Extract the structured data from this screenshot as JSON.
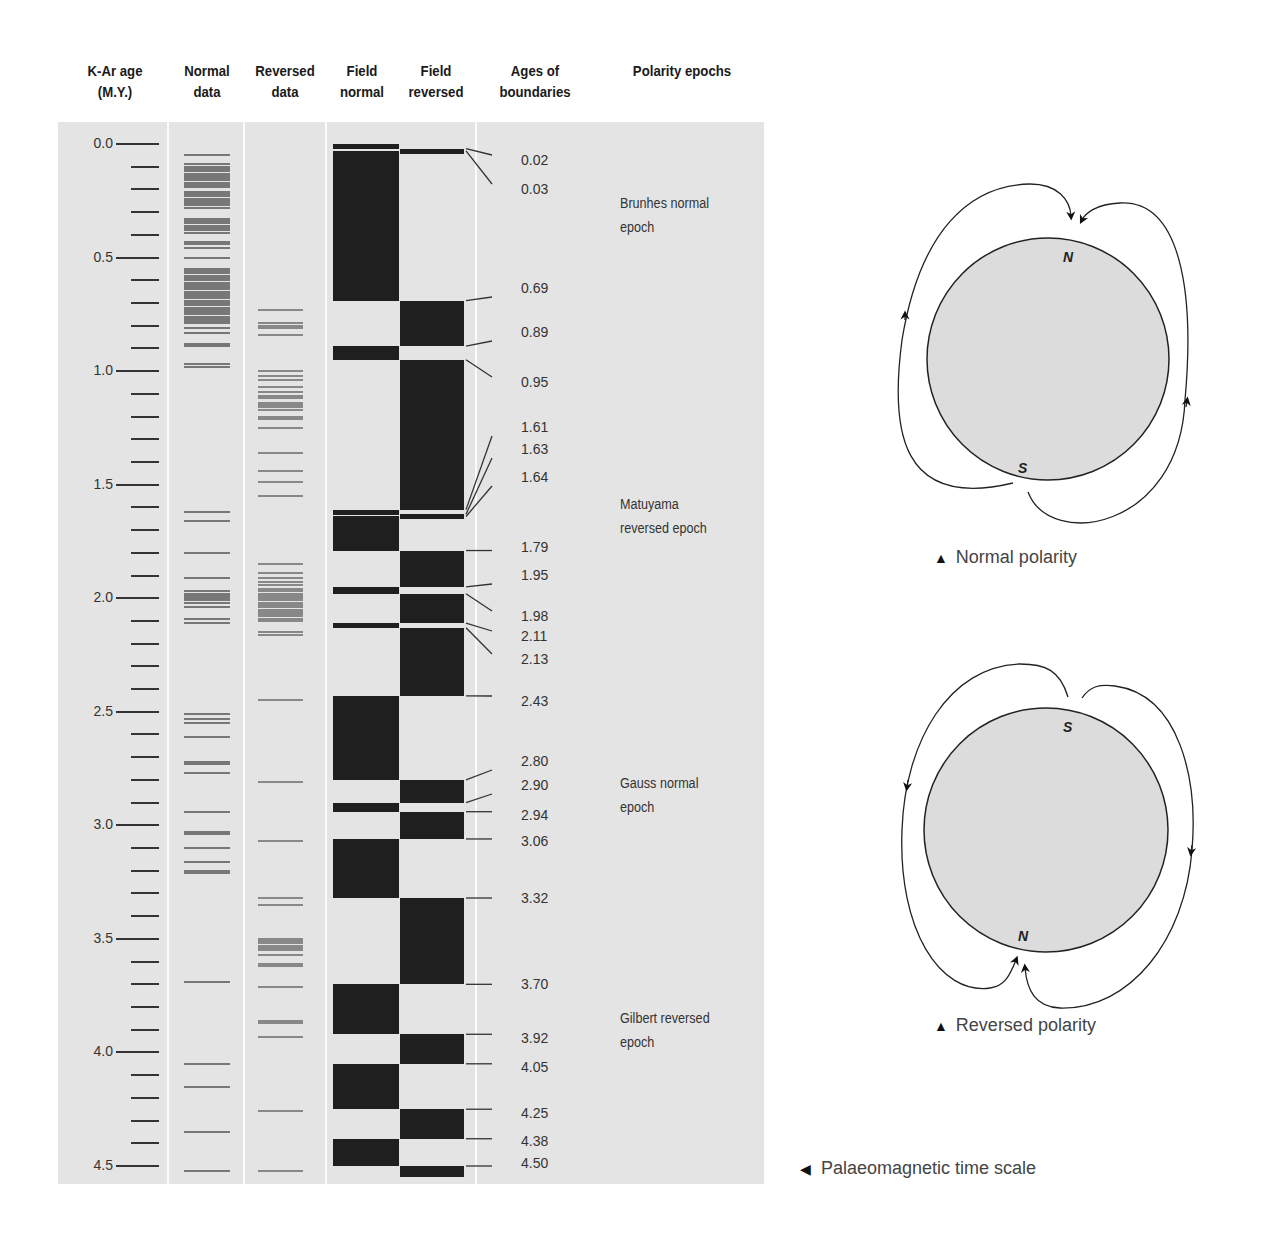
{
  "headers": {
    "age": "K-Ar age\n(M.Y.)",
    "age_l1": "K-Ar age",
    "age_l2": "(M.Y.)",
    "normal_l1": "Normal",
    "normal_l2": "data",
    "reversed_l1": "Reversed",
    "reversed_l2": "data",
    "fnormal_l1": "Field",
    "fnormal_l2": "normal",
    "freversed_l1": "Field",
    "freversed_l2": "reversed",
    "bounds_l1": "Ages of",
    "bounds_l2": "boundaries",
    "epochs": "Polarity epochs"
  },
  "axis": {
    "major_labels": [
      "0.0",
      "0.5",
      "1.0",
      "1.5",
      "2.0",
      "2.5",
      "3.0",
      "3.5",
      "4.0",
      "4.5"
    ]
  },
  "boundaries": [
    "0.02",
    "0.03",
    "0.69",
    "0.89",
    "0.95",
    "1.61",
    "1.63",
    "1.64",
    "1.79",
    "1.95",
    "1.98",
    "2.11",
    "2.13",
    "2.43",
    "2.80",
    "2.90",
    "2.94",
    "3.06",
    "3.32",
    "3.70",
    "3.92",
    "4.05",
    "4.25",
    "4.38",
    "4.50"
  ],
  "epochs": [
    {
      "l1": "Brunhes normal",
      "l2": "epoch"
    },
    {
      "l1": "Matuyama",
      "l2": "reversed epoch"
    },
    {
      "l1": "Gauss normal",
      "l2": "epoch"
    },
    {
      "l1": "Gilbert reversed",
      "l2": "epoch"
    }
  ],
  "diagrams": {
    "normal": {
      "caption": "Normal polarity",
      "top_pole": "N",
      "bottom_pole": "S"
    },
    "reversed": {
      "caption": "Reversed polarity",
      "top_pole": "S",
      "bottom_pole": "N"
    }
  },
  "figure_caption": "Palaeomagnetic time scale",
  "colors": {
    "panel": "#e4e4e4",
    "block": "#1f1f1f",
    "data_line": "#777777"
  },
  "chart_data": {
    "type": "table",
    "title": "Palaeomagnetic time scale",
    "ylabel": "K-Ar age (M.Y.)",
    "ylim": [
      0,
      4.5
    ],
    "y_major_ticks": [
      0.0,
      0.5,
      1.0,
      1.5,
      2.0,
      2.5,
      3.0,
      3.5,
      4.0,
      4.5
    ],
    "y_minor_step": 0.1,
    "columns": [
      "K-Ar age (M.Y.)",
      "Normal data",
      "Reversed data",
      "Field normal",
      "Field reversed",
      "Ages of boundaries",
      "Polarity epochs"
    ],
    "polarity_intervals": [
      {
        "from": 0.0,
        "to": 0.02,
        "polarity": "normal"
      },
      {
        "from": 0.02,
        "to": 0.03,
        "polarity": "reversed"
      },
      {
        "from": 0.03,
        "to": 0.69,
        "polarity": "normal"
      },
      {
        "from": 0.69,
        "to": 0.89,
        "polarity": "reversed"
      },
      {
        "from": 0.89,
        "to": 0.95,
        "polarity": "normal"
      },
      {
        "from": 0.95,
        "to": 1.61,
        "polarity": "reversed"
      },
      {
        "from": 1.61,
        "to": 1.63,
        "polarity": "normal"
      },
      {
        "from": 1.63,
        "to": 1.64,
        "polarity": "reversed"
      },
      {
        "from": 1.64,
        "to": 1.79,
        "polarity": "normal"
      },
      {
        "from": 1.79,
        "to": 1.95,
        "polarity": "reversed"
      },
      {
        "from": 1.95,
        "to": 1.98,
        "polarity": "normal"
      },
      {
        "from": 1.98,
        "to": 2.11,
        "polarity": "reversed"
      },
      {
        "from": 2.11,
        "to": 2.13,
        "polarity": "normal"
      },
      {
        "from": 2.13,
        "to": 2.43,
        "polarity": "reversed"
      },
      {
        "from": 2.43,
        "to": 2.8,
        "polarity": "normal"
      },
      {
        "from": 2.8,
        "to": 2.9,
        "polarity": "reversed"
      },
      {
        "from": 2.9,
        "to": 2.94,
        "polarity": "normal"
      },
      {
        "from": 2.94,
        "to": 3.06,
        "polarity": "reversed"
      },
      {
        "from": 3.06,
        "to": 3.32,
        "polarity": "normal"
      },
      {
        "from": 3.32,
        "to": 3.7,
        "polarity": "reversed"
      },
      {
        "from": 3.7,
        "to": 3.92,
        "polarity": "normal"
      },
      {
        "from": 3.92,
        "to": 4.05,
        "polarity": "reversed"
      },
      {
        "from": 4.05,
        "to": 4.25,
        "polarity": "normal"
      },
      {
        "from": 4.25,
        "to": 4.38,
        "polarity": "reversed"
      },
      {
        "from": 4.38,
        "to": 4.5,
        "polarity": "normal"
      },
      {
        "from": 4.5,
        "to": 4.55,
        "polarity": "reversed"
      }
    ],
    "epochs": [
      {
        "name": "Brunhes normal epoch",
        "from": 0.0,
        "to": 0.69
      },
      {
        "name": "Matuyama reversed epoch",
        "from": 0.69,
        "to": 2.43
      },
      {
        "name": "Gauss normal epoch",
        "from": 2.43,
        "to": 3.32
      },
      {
        "name": "Gilbert reversed epoch",
        "from": 3.32,
        "to": 4.5
      }
    ],
    "normal_data_ages": [
      0.05,
      0.09,
      0.1,
      0.11,
      0.12,
      0.13,
      0.14,
      0.15,
      0.16,
      0.17,
      0.18,
      0.19,
      0.21,
      0.22,
      0.23,
      0.24,
      0.25,
      0.26,
      0.27,
      0.28,
      0.33,
      0.34,
      0.35,
      0.36,
      0.37,
      0.38,
      0.39,
      0.43,
      0.44,
      0.46,
      0.5,
      0.55,
      0.56,
      0.57,
      0.58,
      0.59,
      0.6,
      0.61,
      0.62,
      0.63,
      0.64,
      0.65,
      0.66,
      0.67,
      0.68,
      0.69,
      0.7,
      0.71,
      0.72,
      0.73,
      0.74,
      0.75,
      0.76,
      0.77,
      0.78,
      0.79,
      0.81,
      0.83,
      0.88,
      0.89,
      0.97,
      0.98,
      1.62,
      1.66,
      1.8,
      1.91,
      1.97,
      1.98,
      1.99,
      2.0,
      2.01,
      2.02,
      2.04,
      2.09,
      2.11,
      2.51,
      2.53,
      2.55,
      2.61,
      2.72,
      2.73,
      2.77,
      2.94,
      3.03,
      3.04,
      3.1,
      3.16,
      3.2,
      3.21,
      3.69,
      4.05,
      4.15,
      4.35,
      4.52
    ],
    "reversed_data_ages": [
      0.73,
      0.79,
      0.8,
      0.81,
      0.84,
      1.0,
      1.02,
      1.04,
      1.07,
      1.09,
      1.11,
      1.12,
      1.14,
      1.15,
      1.16,
      1.17,
      1.2,
      1.21,
      1.25,
      1.36,
      1.44,
      1.49,
      1.55,
      1.85,
      1.89,
      1.91,
      1.93,
      1.94,
      1.96,
      1.97,
      1.98,
      1.99,
      2.0,
      2.01,
      2.02,
      2.03,
      2.04,
      2.05,
      2.06,
      2.07,
      2.08,
      2.09,
      2.1,
      2.15,
      2.16,
      2.45,
      2.81,
      3.07,
      3.32,
      3.35,
      3.5,
      3.51,
      3.52,
      3.53,
      3.54,
      3.55,
      3.57,
      3.61,
      3.62,
      3.71,
      3.86,
      3.87,
      3.93,
      4.26,
      4.52
    ]
  }
}
